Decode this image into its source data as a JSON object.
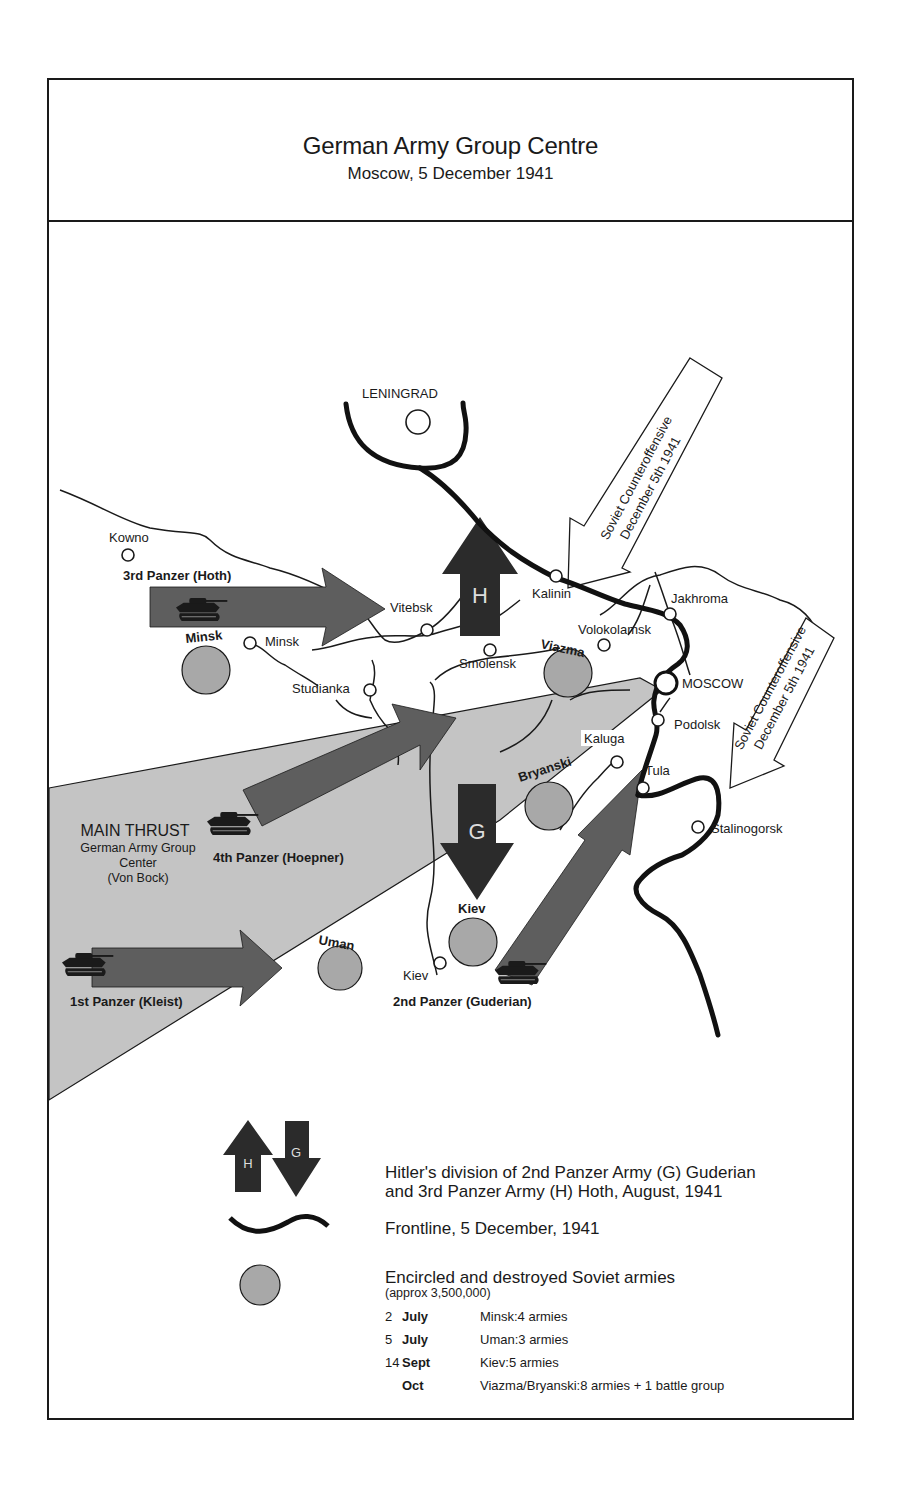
{
  "header": {
    "title": "German Army Group Centre",
    "subtitle": "Moscow, 5 December 1941"
  },
  "map": {
    "cities": {
      "leningrad": "LENINGRAD",
      "kowno": "Kowno",
      "vitebsk": "Vitebsk",
      "minsk": "Minsk",
      "studianka": "Studianka",
      "smolensk": "Smolensk",
      "kalinin": "Kalinin",
      "volokolamsk": "Volokolamsk",
      "jakhroma": "Jakhroma",
      "moscow": "MOSCOW",
      "podolsk": "Podolsk",
      "kaluga": "Kaluga",
      "tula": "Tula",
      "stalinogorsk": "Stalinogorsk",
      "kiev": "Kiev"
    },
    "pockets": {
      "minsk": "Minsk",
      "viazma": "Viazma",
      "bryanski": "Bryanski",
      "kiev": "Kiev",
      "uman": "Uman"
    },
    "armies": {
      "third_panzer": "3rd Panzer (Hoth)",
      "fourth_panzer": "4th Panzer (Hoepner)",
      "first_panzer": "1st Panzer (Kleist)",
      "second_panzer": "2nd Panzer (Guderian)",
      "h_label": "H",
      "g_label": "G"
    },
    "main_thrust": {
      "title": "MAIN THRUST",
      "line1": "German Army Group",
      "line2": "Center",
      "line3": "(Von Bock)"
    },
    "counteroffensive": {
      "line1": "Soviet Counteroffensive",
      "line2": "December 5th 1941"
    },
    "colors": {
      "arrow_fill": "#5e5e5e",
      "dark_arrow_fill": "#2b2b2b",
      "thrust_fill": "#bdbdbd",
      "pocket_fill": "#a8a8a8",
      "line": "#1a1a1a"
    }
  },
  "legend": {
    "division_h": "H",
    "division_g": "G",
    "division_text_1": "Hitler's division of 2nd Panzer Army (G) Guderian",
    "division_text_2": "and 3rd Panzer Army (H) Hoth, August, 1941",
    "frontline_text": "Frontline, 5 December, 1941",
    "encircled_title": "Encircled and destroyed Soviet armies",
    "encircled_note": "(approx 3,500,000)",
    "rows": [
      {
        "day": "2",
        "month": "July",
        "desc": "Minsk:4 armies"
      },
      {
        "day": "5",
        "month": "July",
        "desc": "Uman:3 armies"
      },
      {
        "day": "14",
        "month": "Sept",
        "desc": "Kiev:5 armies"
      },
      {
        "day": "",
        "month": "Oct",
        "desc": "Viazma/Bryanski:8 armies + 1 battle group"
      }
    ]
  }
}
